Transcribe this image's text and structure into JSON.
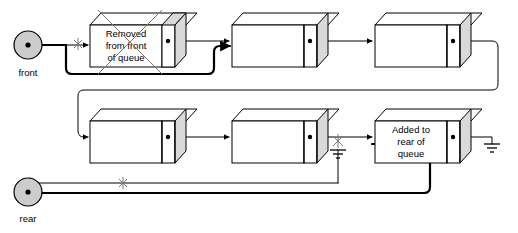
{
  "diagram": {
    "type": "linked-list-queue",
    "background_color": "#ffffff",
    "node_fill": "#ffffff",
    "node_side_fill": "#d9d9d9",
    "pointer_circle_fill": "#cccccc",
    "line_color": "#000000",
    "strike_color": "#777777"
  },
  "pointers": {
    "front": {
      "label": "front",
      "old_link_marker": "x",
      "new_link_marker": ""
    },
    "rear": {
      "label": "rear",
      "old_link_marker": "x",
      "new_link_marker": ""
    }
  },
  "nodes": {
    "top_row": [
      {
        "id": "node-removed",
        "text_lines": [
          "Removed",
          "from front",
          "of queue"
        ],
        "struck_out": true
      },
      {
        "id": "node-2",
        "text_lines": [],
        "struck_out": false
      },
      {
        "id": "node-3",
        "text_lines": [],
        "struck_out": false
      }
    ],
    "bottom_row": [
      {
        "id": "node-4",
        "text_lines": [],
        "struck_out": false
      },
      {
        "id": "node-5",
        "text_lines": [],
        "struck_out": false
      },
      {
        "id": "node-added",
        "text_lines": [
          "Added to",
          "rear of",
          "queue"
        ],
        "struck_out": false
      }
    ]
  },
  "markers": {
    "old_rear_null": {
      "symbol": "ground",
      "struck_out": true,
      "marker": "x"
    },
    "new_rear_null": {
      "symbol": "ground",
      "struck_out": false,
      "marker": ""
    }
  },
  "annotations": {
    "front_strike": "x",
    "rear_strike": "x",
    "old_null_strike": "x"
  }
}
